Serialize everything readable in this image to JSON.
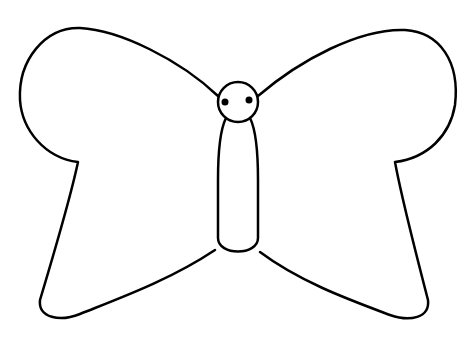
{
  "image": {
    "subject": "butterfly outline drawing",
    "background": "#ffffff",
    "stroke": "#000000"
  }
}
